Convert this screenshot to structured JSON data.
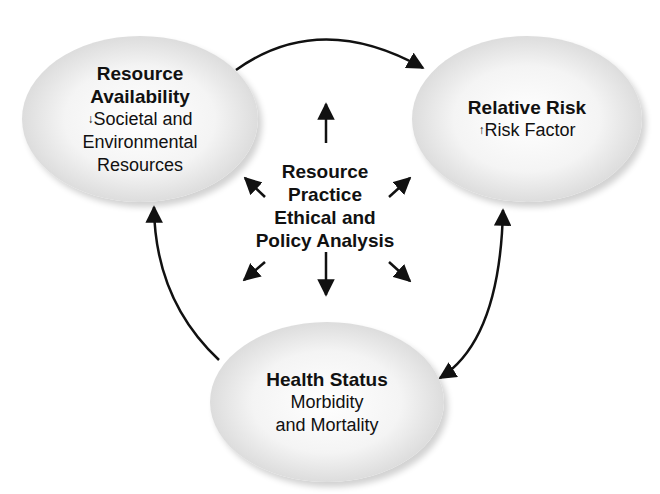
{
  "nodes": {
    "resource_availability": {
      "title_line1": "Resource",
      "title_line2": "Availability",
      "indicator": "down-arrow",
      "sub_line1": "Societal and",
      "sub_line2": "Environmental",
      "sub_line3": "Resources"
    },
    "relative_risk": {
      "title": "Relative Risk",
      "indicator": "up-arrow",
      "sub": "Risk Factor"
    },
    "health_status": {
      "title": "Health Status",
      "sub_line1": "Morbidity",
      "sub_line2": "and Mortality"
    }
  },
  "center": {
    "line1": "Resource",
    "line2": "Practice",
    "line3": "Ethical and",
    "line4": "Policy Analysis"
  },
  "glyphs": {
    "down": "↓",
    "up": "↑"
  },
  "connections": [
    {
      "from": "Resource Availability",
      "to": "Relative Risk",
      "direction": "one-way"
    },
    {
      "from": "Relative Risk",
      "to": "Health Status",
      "direction": "two-way"
    },
    {
      "from": "Health Status",
      "to": "Resource Availability",
      "direction": "one-way"
    }
  ]
}
